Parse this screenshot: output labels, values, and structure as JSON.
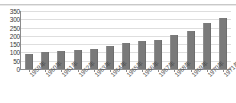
{
  "chart_data": {
    "type": "bar",
    "title": "",
    "subtitle": "",
    "xlabel": "",
    "ylabel": "",
    "categories": [
      "1959年",
      "1960年",
      "1961年",
      "1962年",
      "1963年",
      "1964年",
      "1965年",
      "1966年",
      "1967年",
      "1968年",
      "1969年",
      "1970年",
      "1971年"
    ],
    "values": [
      88,
      103,
      108,
      113,
      122,
      137,
      157,
      168,
      175,
      203,
      230,
      275,
      305
    ],
    "series": [
      {
        "name": "",
        "values": [
          88,
          103,
          108,
          113,
          122,
          137,
          157,
          168,
          175,
          203,
          230,
          275,
          305
        ]
      }
    ],
    "ylim": [
      0,
      350
    ],
    "ytick_labels": [
      "0",
      "50",
      "100",
      "150",
      "200",
      "250",
      "300",
      "350"
    ],
    "ytick_values": [
      0,
      50,
      100,
      150,
      200,
      250,
      300,
      350
    ],
    "grid": true,
    "legend": false,
    "legend_position": "none",
    "bar_color": "#7a7a7a",
    "grid_color": "#dedede",
    "axis_color": "#8c8c8c",
    "background_color": "#ffffff",
    "annotations": []
  }
}
